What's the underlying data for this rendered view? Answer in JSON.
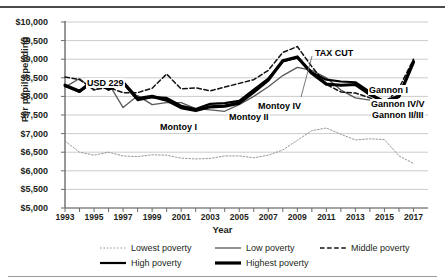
{
  "chart_data": {
    "type": "line",
    "title": "",
    "xlabel": "Year",
    "ylabel": "Per pupil spending",
    "xlim": [
      1993,
      2018
    ],
    "ylim": [
      5000,
      10000
    ],
    "ytick_step": 500,
    "grid": true,
    "legend_position": "bottom",
    "y_ticks": [
      "$10,000",
      "$9,500",
      "$9,000",
      "$8,500",
      "$8,000",
      "$7,500",
      "$7,000",
      "$6,500",
      "$6,000",
      "$5,500",
      "$5,000"
    ],
    "y_tick_values": [
      10000,
      9500,
      9000,
      8500,
      8000,
      7500,
      7000,
      6500,
      6000,
      5500,
      5000
    ],
    "x_ticks": [
      "1993",
      "1995",
      "1997",
      "1999",
      "2001",
      "2003",
      "2005",
      "2007",
      "2009",
      "2011",
      "2013",
      "2015",
      "2017"
    ],
    "x_all_years": [
      1993,
      1994,
      1995,
      1996,
      1997,
      1998,
      1999,
      2000,
      2001,
      2002,
      2003,
      2004,
      2005,
      2006,
      2007,
      2008,
      2009,
      2010,
      2011,
      2012,
      2013,
      2014,
      2015,
      2016,
      2017
    ],
    "series": [
      {
        "name": "Lowest poverty",
        "style": "dotted-fine",
        "color": "#808080",
        "values": [
          6800,
          6500,
          6420,
          6500,
          6400,
          6380,
          6430,
          6420,
          6340,
          6320,
          6330,
          6400,
          6400,
          6350,
          6420,
          6560,
          6820,
          7080,
          7150,
          6980,
          6830,
          6860,
          6840,
          6400,
          6200
        ]
      },
      {
        "name": "Low poverty",
        "style": "thin-solid",
        "color": "#4d4d4d",
        "values": [
          8250,
          8480,
          8160,
          8350,
          7700,
          8020,
          7780,
          7830,
          7830,
          7670,
          7640,
          7600,
          7780,
          8000,
          8260,
          8560,
          8780,
          8700,
          8500,
          8170,
          7960,
          7900,
          7880,
          8050,
          8900
        ]
      },
      {
        "name": "Middle poverty",
        "style": "dashed",
        "color": "#1a1a1a",
        "values": [
          8520,
          8450,
          8180,
          8240,
          8100,
          8100,
          8220,
          8600,
          8200,
          8230,
          8150,
          8250,
          8350,
          8450,
          8700,
          9180,
          9340,
          8800,
          8320,
          8120,
          8090,
          7960,
          7800,
          8220,
          9000
        ]
      },
      {
        "name": "High poverty",
        "style": "medium-solid",
        "color": "#000000",
        "values": [
          8280,
          8120,
          8420,
          8180,
          8360,
          7900,
          7980,
          7960,
          7750,
          7660,
          7800,
          7820,
          7880,
          8180,
          8480,
          8940,
          9040,
          8640,
          8450,
          8400,
          8380,
          8120,
          7730,
          8000,
          8960
        ]
      },
      {
        "name": "Highest poverty",
        "style": "thick-solid",
        "color": "#000000",
        "values": [
          8300,
          8140,
          8440,
          8200,
          8380,
          7940,
          8000,
          7900,
          7700,
          7620,
          7720,
          7740,
          7820,
          8120,
          8440,
          8960,
          9060,
          8620,
          8330,
          8300,
          8320,
          8050,
          7860,
          8000,
          8920
        ]
      }
    ],
    "annotations": [
      {
        "text": "USD 229",
        "x": 86,
        "y": 78
      },
      {
        "text": "TAX CUT",
        "x": 314,
        "y": 48
      },
      {
        "text": "Montoy I",
        "x": 159,
        "y": 122
      },
      {
        "text": "Montoy II",
        "x": 228,
        "y": 112
      },
      {
        "text": "Montoy IV",
        "x": 257,
        "y": 101
      },
      {
        "text": "Gannon I",
        "x": 368,
        "y": 85
      },
      {
        "text": "Gannon IV/V",
        "x": 370,
        "y": 99
      },
      {
        "text": "Gannon II/III",
        "x": 371,
        "y": 110
      }
    ]
  },
  "legend": {
    "items": [
      {
        "label": "Lowest poverty",
        "style": "dotted-fine"
      },
      {
        "label": "Low poverty",
        "style": "thin-solid"
      },
      {
        "label": "Middle poverty",
        "style": "dashed"
      },
      {
        "label": "High poverty",
        "style": "medium-solid"
      },
      {
        "label": "Highest poverty",
        "style": "thick-solid"
      }
    ]
  }
}
